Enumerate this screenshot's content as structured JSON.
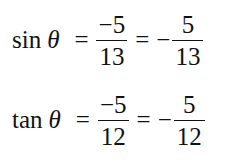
{
  "equations": [
    {
      "function": "sin",
      "variable": "θ",
      "equals": "=",
      "fraction1": {
        "numerator": "−5",
        "denominator": "13"
      },
      "sign": "−",
      "fraction2": {
        "numerator": "5",
        "denominator": "13"
      }
    },
    {
      "function": "tan",
      "variable": "θ",
      "equals": "=",
      "fraction1": {
        "numerator": "−5",
        "denominator": "12"
      },
      "sign": "−",
      "fraction2": {
        "numerator": "5",
        "denominator": "12"
      }
    }
  ]
}
